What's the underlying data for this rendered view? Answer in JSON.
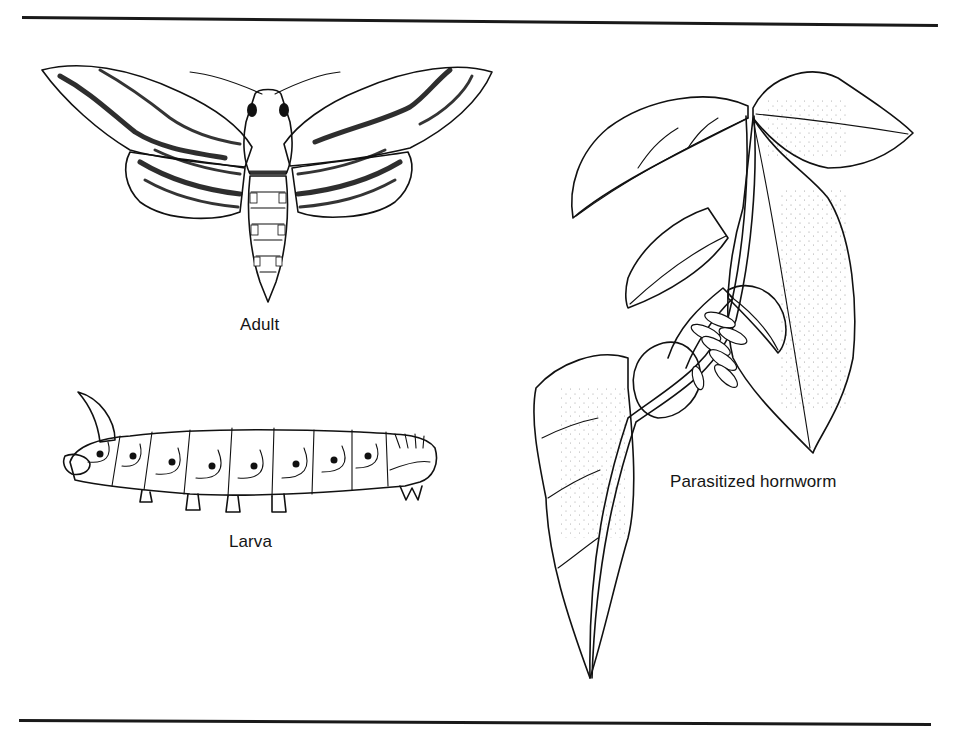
{
  "figure": {
    "illustrations": [
      {
        "id": "adult",
        "label": "Adult",
        "subject": "moth-illustration"
      },
      {
        "id": "larva",
        "label": "Larva",
        "subject": "caterpillar-illustration"
      },
      {
        "id": "parasitized",
        "label": "Parasitized hornworm",
        "subject": "hornworm-on-leaves-with-cocoons-illustration"
      }
    ]
  },
  "colors": {
    "ink": "#111111",
    "background": "#ffffff"
  }
}
